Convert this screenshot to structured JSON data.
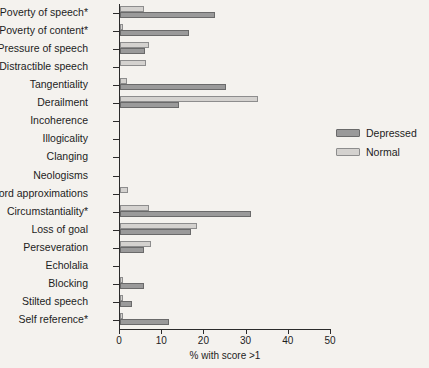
{
  "chart_data": {
    "type": "bar",
    "orientation": "horizontal",
    "title": "",
    "xlabel": "% with score >1",
    "ylabel": "",
    "xlim": [
      0,
      50
    ],
    "xticks": [
      0,
      10,
      20,
      30,
      40,
      50
    ],
    "xtick_labels": [
      "0",
      "10",
      "20",
      "30",
      "40",
      "50"
    ],
    "grid": false,
    "legend_position": "right",
    "categories": [
      "Poverty of speech*",
      "Poverty of content*",
      "Pressure of speech",
      "Distractible speech",
      "Tangentiality",
      "Derailment",
      "Incoherence",
      "Illogicality",
      "Clanging",
      "Neologisms",
      "Word approximations",
      "Circumstantiality*",
      "Loss of goal",
      "Perseveration",
      "Echolalia",
      "Blocking",
      "Stilted speech",
      "Self reference*"
    ],
    "series": [
      {
        "name": "Depressed",
        "color": "#9a9a9a",
        "values": [
          22.4,
          16.4,
          6.0,
          0.0,
          25.2,
          14.0,
          0.0,
          0.0,
          0.0,
          0.0,
          0.0,
          31.0,
          16.9,
          5.7,
          0.0,
          5.7,
          2.9,
          11.7
        ]
      },
      {
        "name": "Normal",
        "color": "#d4d2cf",
        "values": [
          5.7,
          0.7,
          6.9,
          6.2,
          1.7,
          32.6,
          0.0,
          0.0,
          0.0,
          0.0,
          1.9,
          6.9,
          18.3,
          7.4,
          0.0,
          0.7,
          0.7,
          0.7
        ]
      }
    ]
  }
}
